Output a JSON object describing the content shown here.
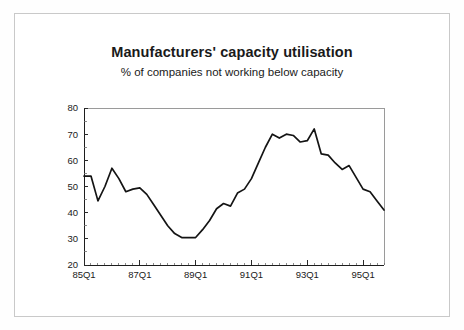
{
  "page": {
    "background_color": "#ffffff",
    "border_color": "#c9c9c9"
  },
  "chart_data": {
    "type": "line",
    "title": "Manufacturers' capacity utilisation",
    "subtitle": "% of companies not working below capacity",
    "xlabel": "",
    "ylabel": "",
    "ylim": [
      20,
      80
    ],
    "yticks": [
      20,
      30,
      40,
      50,
      60,
      70,
      80
    ],
    "ytick_labels": [
      "20",
      "30",
      "40",
      "50",
      "60",
      "70",
      "80"
    ],
    "xtick_labels": [
      "85Q1",
      "87Q1",
      "89Q1",
      "91Q1",
      "93Q1",
      "95Q1"
    ],
    "xtick_positions": [
      0,
      8,
      16,
      24,
      32,
      40
    ],
    "grid": false,
    "legend": false,
    "line_color": "#141414",
    "x": [
      "85Q1",
      "85Q2",
      "85Q3",
      "85Q4",
      "86Q1",
      "86Q2",
      "86Q3",
      "86Q4",
      "87Q1",
      "87Q2",
      "87Q3",
      "87Q4",
      "88Q1",
      "88Q2",
      "88Q3",
      "88Q4",
      "89Q1",
      "89Q2",
      "89Q3",
      "89Q4",
      "90Q1",
      "90Q2",
      "90Q3",
      "90Q4",
      "91Q1",
      "91Q2",
      "91Q3",
      "91Q4",
      "92Q1",
      "92Q2",
      "92Q3",
      "92Q4",
      "93Q1",
      "93Q2",
      "93Q3",
      "93Q4",
      "94Q1",
      "94Q2",
      "94Q3",
      "94Q4",
      "95Q1",
      "95Q2",
      "95Q3",
      "95Q4"
    ],
    "values": [
      54.0,
      54.0,
      44.5,
      50.0,
      57.0,
      53.0,
      48.0,
      49.0,
      49.5,
      47.0,
      43.0,
      39.0,
      35.0,
      32.0,
      30.5,
      30.5,
      30.5,
      33.5,
      37.0,
      41.5,
      43.5,
      42.5,
      47.5,
      49.0,
      53.0,
      59.0,
      65.0,
      70.0,
      68.5,
      70.0,
      69.5,
      67.0,
      67.5,
      72.0,
      62.5,
      62.0,
      59.0,
      56.5,
      58.0,
      53.5,
      49.0,
      48.0,
      44.5,
      41.0
    ],
    "series": [
      {
        "name": "Capacity utilisation",
        "values": [
          54.0,
          54.0,
          44.5,
          50.0,
          57.0,
          53.0,
          48.0,
          49.0,
          49.5,
          47.0,
          43.0,
          39.0,
          35.0,
          32.0,
          30.5,
          30.5,
          30.5,
          33.5,
          37.0,
          41.5,
          43.5,
          42.5,
          47.5,
          49.0,
          53.0,
          59.0,
          65.0,
          70.0,
          68.5,
          70.0,
          69.5,
          67.0,
          67.5,
          72.0,
          62.5,
          62.0,
          59.0,
          56.5,
          58.0,
          53.5,
          49.0,
          48.0,
          44.5,
          41.0
        ]
      }
    ]
  }
}
